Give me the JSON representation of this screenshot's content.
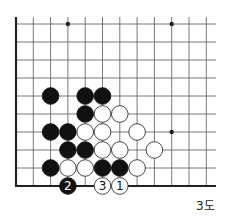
{
  "diagram": {
    "caption": "3도",
    "grid": {
      "origin_x": 16,
      "origin_y": 24,
      "col_spacing": 17.3,
      "row_spacing": 18,
      "cols": 12,
      "rows": 10,
      "right_extent": 216,
      "left_edge_top": 17
    },
    "colors": {
      "black": "#111111",
      "white": "#ffffff",
      "line": "#555555",
      "edge": "#222222"
    },
    "star_points": [
      {
        "c": 3,
        "r": 0
      },
      {
        "c": 9,
        "r": 0
      },
      {
        "c": 9,
        "r": 6
      }
    ],
    "stones": [
      {
        "c": 2,
        "r": 4,
        "color": "black"
      },
      {
        "c": 4,
        "r": 4,
        "color": "black"
      },
      {
        "c": 5,
        "r": 4,
        "color": "black"
      },
      {
        "c": 4,
        "r": 5,
        "color": "black"
      },
      {
        "c": 5,
        "r": 5,
        "color": "white"
      },
      {
        "c": 6,
        "r": 5,
        "color": "white"
      },
      {
        "c": 2,
        "r": 6,
        "color": "black"
      },
      {
        "c": 3,
        "r": 6,
        "color": "black"
      },
      {
        "c": 4,
        "r": 6,
        "color": "white"
      },
      {
        "c": 5,
        "r": 6,
        "color": "white"
      },
      {
        "c": 7,
        "r": 6,
        "color": "white"
      },
      {
        "c": 3,
        "r": 7,
        "color": "black"
      },
      {
        "c": 4,
        "r": 7,
        "color": "black"
      },
      {
        "c": 5,
        "r": 7,
        "color": "white"
      },
      {
        "c": 6,
        "r": 7,
        "color": "white"
      },
      {
        "c": 8,
        "r": 7,
        "color": "white"
      },
      {
        "c": 2,
        "r": 8,
        "color": "black"
      },
      {
        "c": 3,
        "r": 8,
        "color": "white"
      },
      {
        "c": 4,
        "r": 8,
        "color": "white"
      },
      {
        "c": 5,
        "r": 8,
        "color": "black"
      },
      {
        "c": 6,
        "r": 8,
        "color": "black"
      },
      {
        "c": 7,
        "r": 8,
        "color": "white"
      },
      {
        "c": 3,
        "r": 9,
        "color": "black",
        "label": "2"
      },
      {
        "c": 5,
        "r": 9,
        "color": "white",
        "label": "3"
      },
      {
        "c": 6,
        "r": 9,
        "color": "white",
        "label": "1"
      }
    ]
  }
}
